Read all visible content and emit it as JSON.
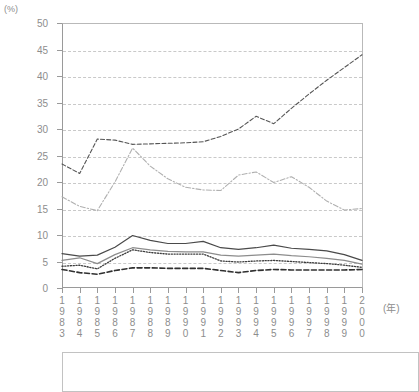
{
  "chart_data": {
    "type": "line",
    "title": "",
    "xlabel": "(年)",
    "ylabel": "(%)",
    "y_unit": "(%)",
    "x_unit": "(年)",
    "ylim": [
      0,
      50
    ],
    "ytick_step": 5,
    "yticks": [
      "0",
      "5",
      "10",
      "15",
      "20",
      "25",
      "30",
      "35",
      "40",
      "45",
      "50"
    ],
    "grid": true,
    "legend_position": "below-plot",
    "categories": [
      "1983",
      "1984",
      "1985",
      "1986",
      "1987",
      "1988",
      "1989",
      "1990",
      "1991",
      "1992",
      "1993",
      "1994",
      "1995",
      "1996",
      "1997",
      "1998",
      "1999",
      "2000"
    ],
    "series": [
      {
        "name": "series-1",
        "style": "dashed",
        "color": "#555555",
        "values": [
          23.4,
          21.6,
          28.1,
          27.9,
          27.1,
          27.2,
          27.3,
          27.4,
          27.6,
          28.6,
          30.0,
          32.4,
          31.0,
          33.9,
          36.6,
          39.2,
          41.6,
          44.0
        ]
      },
      {
        "name": "series-2",
        "style": "dash-dot",
        "color": "#b0b0b0",
        "values": [
          17.2,
          15.4,
          14.6,
          20.0,
          26.4,
          23.0,
          20.6,
          19.0,
          18.5,
          18.4,
          21.3,
          21.9,
          19.9,
          21.0,
          19.0,
          16.4,
          14.7,
          15.0
        ]
      },
      {
        "name": "series-3",
        "style": "solid",
        "color": "#4a4a4a",
        "values": [
          6.5,
          6.0,
          6.2,
          7.7,
          9.9,
          9.0,
          8.4,
          8.4,
          8.8,
          7.6,
          7.3,
          7.6,
          8.1,
          7.5,
          7.3,
          7.0,
          6.3,
          5.2
        ]
      },
      {
        "name": "series-4",
        "style": "solid-gray",
        "color": "#8c8c8c",
        "values": [
          5.2,
          5.7,
          4.6,
          6.3,
          7.6,
          7.2,
          6.9,
          6.8,
          6.8,
          6.2,
          6.0,
          6.2,
          6.4,
          6.1,
          5.9,
          5.6,
          5.2,
          4.5
        ]
      },
      {
        "name": "series-5",
        "style": "dotted",
        "color": "#3d3d3d",
        "values": [
          4.1,
          4.3,
          3.6,
          5.6,
          7.2,
          6.7,
          6.4,
          6.4,
          6.4,
          5.1,
          4.9,
          5.1,
          5.2,
          5.0,
          4.8,
          4.6,
          4.3,
          3.9
        ]
      },
      {
        "name": "series-6",
        "style": "thick-dashed",
        "color": "#303030",
        "values": [
          3.5,
          2.9,
          2.6,
          3.3,
          3.8,
          3.8,
          3.7,
          3.7,
          3.7,
          3.3,
          2.9,
          3.3,
          3.5,
          3.4,
          3.4,
          3.4,
          3.4,
          3.5
        ]
      }
    ]
  }
}
